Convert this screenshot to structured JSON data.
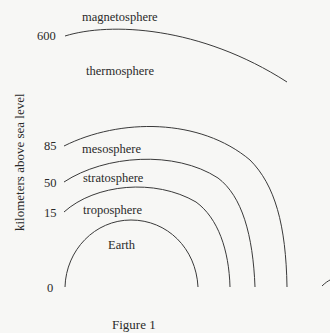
{
  "figure": {
    "caption": "Figure 1",
    "y_axis_label": "kilometers above sea level",
    "ticks": [
      {
        "value": "600"
      },
      {
        "value": "85"
      },
      {
        "value": "50"
      },
      {
        "value": "15"
      },
      {
        "value": "0"
      }
    ],
    "layers": [
      {
        "name": "magnetosphere"
      },
      {
        "name": "thermosphere"
      },
      {
        "name": "mesosphere"
      },
      {
        "name": "stratosphere"
      },
      {
        "name": "troposphere"
      },
      {
        "name": "Earth"
      }
    ],
    "colors": {
      "background": "#f7f7f5",
      "line": "#3a3a3a",
      "text": "#2a2a2a"
    }
  }
}
